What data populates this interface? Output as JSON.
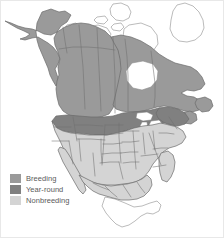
{
  "map": {
    "title": "North America species range map",
    "region": "North America",
    "projection_note": "continental outline with state and province boundaries",
    "background_color": "#ffffff",
    "outline_color": "#6b6b6b",
    "boundary_color": "#7a7a7a",
    "unfilled_color": "#ffffff",
    "unfilled_areas": [
      "Arctic Archipelago",
      "Greenland",
      "Hudson Bay",
      "Southern Mexico",
      "Yucatan Peninsula"
    ],
    "shaded_areas": {
      "breeding": [
        "Alaska",
        "Yukon",
        "British Columbia",
        "Alberta",
        "Saskatchewan",
        "Manitoba",
        "Ontario",
        "Quebec",
        "Labrador",
        "Newfoundland"
      ],
      "year_round": [
        "Pacific Northwest",
        "Northern Rockies",
        "Northern Plains",
        "Great Lakes",
        "New England"
      ],
      "nonbreeding": [
        "Southwestern United States",
        "Southern United States",
        "Gulf Coast",
        "Atlantic Coast",
        "Baja California",
        "Northern Mexico"
      ]
    }
  },
  "legend": {
    "name": "range-legend",
    "items": [
      {
        "label": "Breeding",
        "color": "#9a9a9a"
      },
      {
        "label": "Year-round",
        "color": "#808080"
      },
      {
        "label": "Nonbreeding",
        "color": "#d4d4d4"
      }
    ]
  },
  "colors": {
    "breeding": "#9a9a9a",
    "year_round": "#808080",
    "nonbreeding": "#d4d4d4",
    "outline": "#6b6b6b",
    "boundary": "#7a7a7a",
    "legend_text": "#5a5a5a",
    "background": "#ffffff"
  }
}
